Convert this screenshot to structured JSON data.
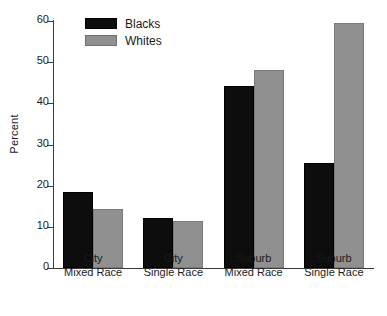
{
  "chart_data": {
    "type": "bar",
    "title": "",
    "xlabel": "",
    "ylabel": "Percent",
    "ylim": [
      0,
      60
    ],
    "yticks": [
      0,
      10,
      20,
      30,
      40,
      50,
      60
    ],
    "grid": false,
    "legend_position": "top-left-inside",
    "categories": [
      "City\nMixed Race",
      "City\nSingle Race",
      "Suburb\nMixed Race",
      "Suburb\nSingle Race"
    ],
    "category_lines": [
      [
        "City",
        "Mixed Race"
      ],
      [
        "City",
        "Single Race"
      ],
      [
        "Suburb",
        "Mixed Race"
      ],
      [
        "Suburb",
        "Single Race"
      ]
    ],
    "series": [
      {
        "name": "Blacks",
        "color": "#0d0d0d",
        "values": [
          18.4,
          12.1,
          44.2,
          25.5
        ]
      },
      {
        "name": "Whites",
        "color": "#909090",
        "values": [
          14.3,
          11.4,
          48.2,
          59.6
        ]
      }
    ]
  },
  "legend": {
    "items": [
      {
        "label": "Blacks",
        "swatch": "blacks"
      },
      {
        "label": "Whites",
        "swatch": "whites"
      }
    ]
  },
  "axis": {
    "y_label": "Percent",
    "y_tick_labels": [
      "0",
      "10",
      "20",
      "30",
      "40",
      "50",
      "60"
    ]
  }
}
